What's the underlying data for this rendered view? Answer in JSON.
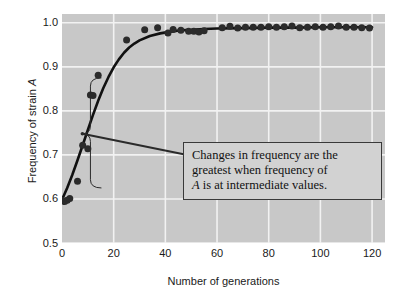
{
  "chart_data": {
    "type": "scatter",
    "title": "",
    "xlabel": "Number of generations",
    "ylabel_prefix": "Frequency of strain ",
    "ylabel_italic": "A",
    "xlim": [
      0,
      125
    ],
    "ylim": [
      0.5,
      1.02
    ],
    "xticks": [
      0,
      20,
      40,
      60,
      80,
      100,
      120
    ],
    "yticks": [
      "0.5",
      "0.6",
      "0.7",
      "0.8",
      "0.9",
      "1.0"
    ],
    "ytick_values": [
      0.5,
      0.6,
      0.7,
      0.8,
      0.9,
      1.0
    ],
    "grid": true,
    "grid_color": "#f2f2f2",
    "plot_background": "#c8c8c8",
    "legend": "none",
    "marker_color": "#2b2b2b",
    "line_color": "#111111",
    "series": [
      {
        "name": "Frequency of strain A",
        "marker": "filled-circle",
        "x": [
          0,
          1,
          2,
          3,
          6,
          8,
          10,
          11,
          12,
          14,
          25,
          32,
          37,
          41,
          43,
          46,
          49,
          51,
          53,
          55,
          62,
          65,
          68,
          71,
          74,
          77,
          80,
          83,
          86,
          89,
          92,
          95,
          98,
          101,
          104,
          107,
          110,
          113,
          116,
          119
        ],
        "y": [
          0.597,
          0.594,
          0.597,
          0.601,
          0.64,
          0.722,
          0.714,
          0.836,
          0.835,
          0.881,
          0.961,
          0.984,
          0.989,
          0.977,
          0.985,
          0.983,
          0.981,
          0.981,
          0.979,
          0.982,
          0.989,
          0.992,
          0.988,
          0.99,
          0.99,
          0.99,
          0.991,
          0.99,
          0.991,
          0.993,
          0.989,
          0.99,
          0.991,
          0.99,
          0.991,
          0.993,
          0.99,
          0.99,
          0.989,
          0.988
        ]
      }
    ],
    "fitted_curve": {
      "name": "logistic fit",
      "x": [
        0,
        2,
        4,
        6,
        8,
        10,
        12,
        14,
        16,
        18,
        20,
        22,
        24,
        26,
        28,
        30,
        34,
        38,
        42,
        46,
        50,
        55,
        60,
        70,
        80,
        90,
        100,
        110,
        120
      ],
      "y": [
        0.598,
        0.625,
        0.655,
        0.688,
        0.722,
        0.757,
        0.791,
        0.823,
        0.852,
        0.877,
        0.899,
        0.917,
        0.932,
        0.944,
        0.953,
        0.96,
        0.97,
        0.976,
        0.98,
        0.983,
        0.984,
        0.986,
        0.987,
        0.988,
        0.989,
        0.989,
        0.99,
        0.99,
        0.99
      ]
    },
    "annotations": [
      {
        "type": "text-callout",
        "lines": [
          "Changes in frequency are the",
          "greatest when frequency of",
          "A is at intermediate values."
        ],
        "italic_token": "A",
        "brace": {
          "orientation": "vertical-right",
          "x_data_range": [
            11,
            11
          ],
          "y_data_range": [
            0.625,
            0.875
          ],
          "pointer_y": 0.748
        }
      }
    ]
  },
  "axes": {
    "x_tick_labels": [
      "0",
      "20",
      "40",
      "60",
      "80",
      "100",
      "120"
    ],
    "y_tick_labels": [
      "1.0",
      "0.9",
      "0.8",
      "0.7",
      "0.6",
      "0.5"
    ]
  }
}
